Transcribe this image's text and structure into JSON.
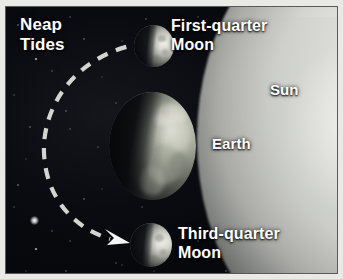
{
  "figure": {
    "background_color": "#090a0e",
    "frame_color": "#e9e9e6",
    "label_color": "#ffffff"
  },
  "labels": {
    "neap_tides": "Neap\nTides",
    "first_quarter_moon": "First-quarter\nMoon",
    "sun": "Sun",
    "earth": "Earth",
    "third_quarter_moon": "Third-quarter\nMoon"
  },
  "bodies": [
    {
      "name": "sun",
      "label": "Sun",
      "role": "light-source",
      "position": "right-edge",
      "appearance": "large glowing limb, partially off-frame",
      "color": "#fbfbf8"
    },
    {
      "name": "earth",
      "label": "Earth",
      "role": "center-body",
      "position": "center",
      "appearance": "globe with bright atmospheric halo, day side facing Sun",
      "color": "#c8cabd"
    },
    {
      "name": "first-quarter-moon",
      "label": "First-quarter\nMoon",
      "role": "moon",
      "position": "above-earth",
      "appearance": "half-lit sphere, lit limb facing Sun",
      "color": "#d8d9d0"
    },
    {
      "name": "third-quarter-moon",
      "label": "Third-quarter\nMoon",
      "role": "moon",
      "position": "below-earth",
      "appearance": "half-lit sphere, lit limb facing Sun",
      "color": "#d8d9d0"
    }
  ],
  "orbit": {
    "style": "dashed",
    "color": "#e8e8e2",
    "direction": "counter-clockwise",
    "arrowhead": "at lower end, pointing toward third-quarter moon",
    "description": "dashed arc sweeping from the first-quarter moon around the left side of Earth down to the third-quarter moon"
  },
  "icons": {
    "arrowhead": "arrow-right-down-icon",
    "star": "star-icon"
  }
}
